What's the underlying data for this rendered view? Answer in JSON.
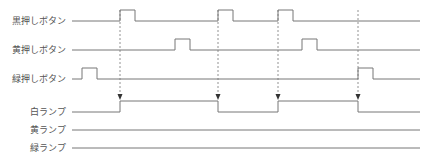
{
  "signals": [
    {
      "label": "黒押しボタン",
      "type": "input",
      "baseline_y": 21,
      "high_y": 10,
      "pulses": [
        [
          120,
          135
        ],
        [
          218,
          233
        ],
        [
          278,
          293
        ]
      ]
    },
    {
      "label": "黄押しボタン",
      "type": "input",
      "baseline_y": 50,
      "high_y": 39,
      "pulses": [
        [
          175,
          190
        ],
        [
          302,
          317
        ]
      ]
    },
    {
      "label": "緑押しボタン",
      "type": "input",
      "baseline_y": 79,
      "high_y": 68,
      "pulses": [
        [
          82,
          97
        ],
        [
          358,
          373
        ]
      ]
    },
    {
      "label": "白ランプ",
      "type": "output",
      "baseline_y": 112,
      "high_y": 101,
      "high_intervals": [
        [
          120,
          218
        ],
        [
          278,
          358
        ]
      ]
    },
    {
      "label": "黄ランプ",
      "type": "output",
      "baseline_y": 130,
      "high_y": 119,
      "high_intervals": []
    },
    {
      "label": "緑ランプ",
      "type": "output",
      "baseline_y": 148,
      "high_y": 137,
      "high_intervals": []
    }
  ],
  "trigger_arrows": [
    120,
    218,
    278,
    358
  ],
  "line_start_x": 72,
  "line_end_x": 420
}
